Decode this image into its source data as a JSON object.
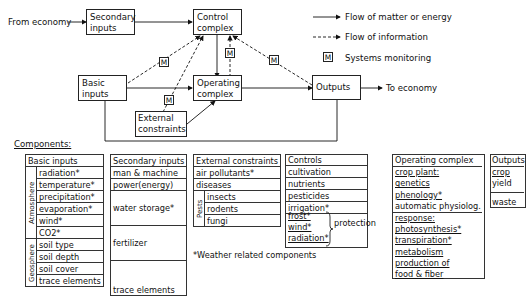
{
  "diagram": {
    "nodes": {
      "from_economy": "From economy",
      "secondary_inputs": [
        "Secondary",
        "inputs"
      ],
      "control_complex": [
        "Control",
        "complex"
      ],
      "basic_inputs": [
        "Basic",
        "inputs"
      ],
      "operating_complex": [
        "Operating",
        "complex"
      ],
      "external_constraints": [
        "External",
        "constraints"
      ],
      "outputs": "Outputs",
      "to_economy": "To economy"
    },
    "monitor_label": "M",
    "legend": {
      "matter": "Flow of matter or energy",
      "information": "Flow of information",
      "monitoring": "Systems monitoring"
    }
  },
  "components": {
    "title": "Components:",
    "basic_inputs": {
      "header": "Basic inputs",
      "atmosphere_label": "Atmosphere",
      "atmosphere": [
        "radiation*",
        "temperature*",
        "precipitation*",
        "evaporation*",
        "wind*",
        "CO2*"
      ],
      "geosphere_label": "Geosphere",
      "geosphere": [
        "soil type",
        "soil depth",
        "soil cover",
        "trace elements"
      ]
    },
    "secondary_inputs": {
      "header": "Secondary inputs",
      "items": [
        "man & machine",
        "power(energy)",
        "water storage*",
        "fertilizer",
        "trace elements"
      ]
    },
    "external_constraints": {
      "header": "External constraints",
      "items": [
        "air pollutants*",
        "diseases"
      ],
      "pests_label": "Pests",
      "pests": [
        "insects",
        "rodents",
        "fungi"
      ]
    },
    "controls": {
      "header": "Controls",
      "items": [
        "cultivation",
        "nutrients",
        "pesticides",
        "irrigation*"
      ],
      "protection_items": [
        "frost*",
        "wind*",
        "radiation*"
      ],
      "protection_label": "protection"
    },
    "operating_complex": {
      "header": "Operating complex",
      "items": [
        "crop plant:",
        "genetics",
        "phenology*",
        "automatic physiolog.",
        "response:",
        "photosynthesis*",
        "transpiration*",
        "metabolism",
        "production of",
        "food & fiber"
      ]
    },
    "outputs": {
      "header": "Outputs",
      "items": [
        "crop",
        "yield",
        "waste"
      ]
    },
    "footnote": "*Weather related components"
  }
}
